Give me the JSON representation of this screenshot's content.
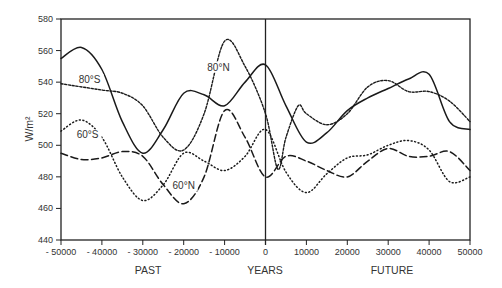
{
  "chart_data": {
    "type": "line",
    "title": "",
    "xlabel": "YEARS",
    "xlabel_left": "PAST",
    "xlabel_right": "FUTURE",
    "ylabel": "W/m²",
    "xlim": [
      -50000,
      50000
    ],
    "ylim": [
      440,
      580
    ],
    "x_ticks": [
      -50000,
      -40000,
      -30000,
      -20000,
      -10000,
      0,
      10000,
      20000,
      30000,
      40000,
      50000
    ],
    "x_tick_labels": [
      "- 50000",
      "- 40000",
      "- 30000",
      "- 20000",
      "- 10000",
      "0",
      "10000",
      "20000",
      "30000",
      "40000",
      "50000"
    ],
    "y_ticks": [
      440,
      460,
      480,
      500,
      520,
      540,
      560,
      580
    ],
    "y_tick_labels": [
      "440",
      "460",
      "480",
      "500",
      "520",
      "540",
      "560",
      "580"
    ],
    "grid": false,
    "legend": "inline labels",
    "vertical_reference_line_at": 0,
    "series": [
      {
        "name": "80°S",
        "style": "solid",
        "label_pos": [
          -43000,
          540
        ],
        "x": [
          -50000,
          -45000,
          -40000,
          -35000,
          -30000,
          -25000,
          -20000,
          -15000,
          -10000,
          -5000,
          0,
          5000,
          10000,
          15000,
          20000,
          25000,
          30000,
          35000,
          40000,
          45000,
          50000
        ],
        "values": [
          555,
          562,
          548,
          515,
          495,
          510,
          533,
          532,
          525,
          540,
          551,
          525,
          502,
          508,
          522,
          530,
          536,
          542,
          545,
          515,
          510
        ]
      },
      {
        "name": "80°N",
        "style": "short-dash",
        "label_pos": [
          -11500,
          548
        ],
        "x": [
          -50000,
          -40000,
          -35000,
          -30000,
          -25000,
          -20000,
          -15000,
          -10000,
          -5000,
          0,
          3000,
          5000,
          8000,
          10000,
          15000,
          20000,
          25000,
          30000,
          35000,
          40000,
          45000,
          50000
        ],
        "values": [
          539,
          535,
          533,
          525,
          505,
          497,
          520,
          566,
          550,
          520,
          485,
          505,
          525,
          520,
          513,
          520,
          537,
          541,
          534,
          534,
          528,
          515
        ]
      },
      {
        "name": "60°S",
        "style": "dotted",
        "label_pos": [
          -43500,
          505
        ],
        "x": [
          -50000,
          -45000,
          -40000,
          -35000,
          -30000,
          -25000,
          -20000,
          -15000,
          -10000,
          -5000,
          0,
          5000,
          10000,
          15000,
          20000,
          25000,
          30000,
          35000,
          40000,
          45000,
          50000
        ],
        "values": [
          509,
          516,
          505,
          480,
          465,
          475,
          495,
          490,
          484,
          493,
          510,
          483,
          470,
          482,
          492,
          494,
          500,
          503,
          497,
          477,
          480
        ]
      },
      {
        "name": "60°N",
        "style": "long-dash",
        "label_pos": [
          -20000,
          473
        ],
        "x": [
          -50000,
          -45000,
          -40000,
          -35000,
          -30000,
          -25000,
          -20000,
          -15000,
          -10000,
          -5000,
          0,
          5000,
          10000,
          15000,
          20000,
          25000,
          30000,
          35000,
          40000,
          45000,
          50000
        ],
        "values": [
          495,
          491,
          492,
          496,
          493,
          475,
          463,
          480,
          522,
          505,
          480,
          493,
          490,
          484,
          480,
          490,
          498,
          493,
          493,
          496,
          484
        ]
      }
    ]
  }
}
